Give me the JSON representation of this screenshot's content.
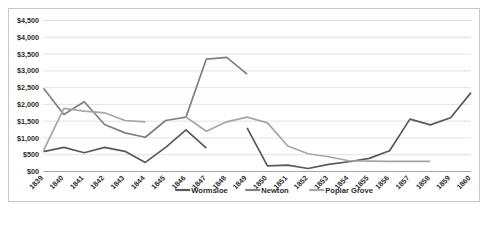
{
  "chart_data": {
    "type": "line",
    "title": "",
    "xlabel": "",
    "ylabel": "",
    "grid": true,
    "legend_position": "bottom",
    "ylim": [
      0,
      4500
    ],
    "ytick_labels": [
      "$00",
      "$500",
      "$1,000",
      "$1,500",
      "$2,000",
      "$2,500",
      "$3,000",
      "$3,500",
      "$4,000",
      "$4,500"
    ],
    "ytick_values": [
      0,
      500,
      1000,
      1500,
      2000,
      2500,
      3000,
      3500,
      4000,
      4500
    ],
    "categories": [
      "1839",
      "1840",
      "1841",
      "1842",
      "1843",
      "1844",
      "1845",
      "1846",
      "1847",
      "1848",
      "1849",
      "1850",
      "1851",
      "1852",
      "1853",
      "1854",
      "1855",
      "1856",
      "1857",
      "1858",
      "1859",
      "1860"
    ],
    "series": [
      {
        "name": "Wormsloe",
        "color": "#595959",
        "values": [
          590,
          720,
          560,
          720,
          600,
          270,
          720,
          1240,
          700,
          null,
          1300,
          170,
          190,
          90,
          210,
          290,
          390,
          620,
          1560,
          1390,
          1600,
          2350
        ]
      },
      {
        "name": "Newton",
        "color": "#808080",
        "values": [
          2480,
          1700,
          2080,
          1400,
          1150,
          1020,
          1520,
          1620,
          3350,
          3400,
          2900,
          null,
          null,
          null,
          null,
          null,
          null,
          null,
          null,
          null,
          null,
          null
        ]
      },
      {
        "name": "Poplar Grove",
        "color": "#a6a6a6",
        "values": [
          620,
          1880,
          1800,
          1750,
          1520,
          1480,
          null,
          1620,
          1200,
          1480,
          1620,
          1450,
          760,
          530,
          440,
          320,
          310,
          300,
          300,
          300,
          null,
          null
        ]
      }
    ],
    "legend_entries": [
      {
        "label": "Wormsloe",
        "color": "#595959"
      },
      {
        "label": "Newton",
        "color": "#808080"
      },
      {
        "label": "Poplar Grove",
        "color": "#a6a6a6"
      }
    ]
  }
}
